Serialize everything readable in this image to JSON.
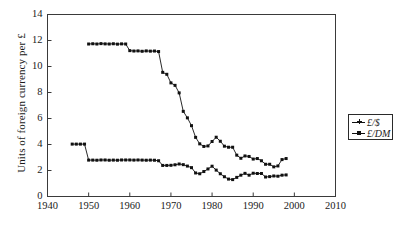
{
  "chart_data": {
    "type": "line",
    "title": "",
    "xlabel": "",
    "ylabel": "Units of foreign currency per £",
    "xlim": [
      1940,
      2010
    ],
    "ylim": [
      0,
      14
    ],
    "xticks": [
      1940,
      1950,
      1960,
      1970,
      1980,
      1990,
      2000,
      2010
    ],
    "yticks": [
      0,
      2,
      4,
      6,
      8,
      10,
      12,
      14
    ],
    "grid": false,
    "legend_position": "right-outside",
    "marker": "square",
    "series": [
      {
        "name": "£/$",
        "legend_marker": "plus",
        "x": [
          1946,
          1947,
          1948,
          1949,
          1950,
          1951,
          1952,
          1953,
          1954,
          1955,
          1956,
          1957,
          1958,
          1959,
          1960,
          1961,
          1962,
          1963,
          1964,
          1965,
          1966,
          1967,
          1968,
          1969,
          1970,
          1971,
          1972,
          1973,
          1974,
          1975,
          1976,
          1977,
          1978,
          1979,
          1980,
          1981,
          1982,
          1983,
          1984,
          1985,
          1986,
          1987,
          1988,
          1989,
          1990,
          1991,
          1992,
          1993,
          1994,
          1995,
          1996,
          1997,
          1998
        ],
        "values": [
          4.03,
          4.03,
          4.03,
          4.03,
          2.8,
          2.8,
          2.79,
          2.81,
          2.81,
          2.79,
          2.8,
          2.79,
          2.81,
          2.81,
          2.81,
          2.8,
          2.81,
          2.8,
          2.79,
          2.8,
          2.79,
          2.75,
          2.39,
          2.39,
          2.4,
          2.44,
          2.5,
          2.45,
          2.34,
          2.22,
          1.81,
          1.75,
          1.92,
          2.12,
          2.33,
          2.03,
          1.75,
          1.52,
          1.34,
          1.3,
          1.47,
          1.64,
          1.78,
          1.64,
          1.79,
          1.77,
          1.77,
          1.5,
          1.53,
          1.58,
          1.56,
          1.64,
          1.66
        ]
      },
      {
        "name": "£/DM",
        "legend_marker": "square",
        "x": [
          1950,
          1951,
          1952,
          1953,
          1954,
          1955,
          1956,
          1957,
          1958,
          1959,
          1960,
          1961,
          1962,
          1963,
          1964,
          1965,
          1966,
          1967,
          1968,
          1969,
          1970,
          1971,
          1972,
          1973,
          1974,
          1975,
          1976,
          1977,
          1978,
          1979,
          1980,
          1981,
          1982,
          1983,
          1984,
          1985,
          1986,
          1987,
          1988,
          1989,
          1990,
          1991,
          1992,
          1993,
          1994,
          1995,
          1996,
          1997,
          1998
        ],
        "values": [
          11.73,
          11.75,
          11.73,
          11.76,
          11.74,
          11.73,
          11.75,
          11.72,
          11.74,
          11.73,
          11.22,
          11.19,
          11.2,
          11.17,
          11.2,
          11.18,
          11.19,
          11.15,
          9.55,
          9.4,
          8.74,
          8.55,
          7.97,
          6.55,
          6.05,
          5.45,
          4.55,
          4.05,
          3.85,
          3.89,
          4.23,
          4.56,
          4.25,
          3.87,
          3.79,
          3.79,
          3.18,
          2.94,
          3.12,
          3.08,
          2.88,
          2.92,
          2.75,
          2.48,
          2.48,
          2.28,
          2.35,
          2.84,
          2.92
        ]
      }
    ]
  }
}
